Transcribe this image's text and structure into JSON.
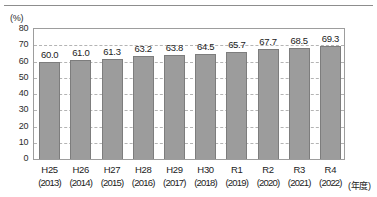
{
  "chart_data": {
    "type": "bar",
    "title": "",
    "xlabel": "(年度)",
    "ylabel": "(%)",
    "ylim": [
      0,
      80
    ],
    "ytick_step": 10,
    "yticks": [
      "80",
      "70",
      "60",
      "50",
      "40",
      "30",
      "20",
      "10",
      "0"
    ],
    "grid": true,
    "legend": "none",
    "categories": [
      "H25",
      "H26",
      "H27",
      "H28",
      "H29",
      "H30",
      "R1",
      "R2",
      "R3",
      "R4"
    ],
    "category_years": [
      "(2013)",
      "(2014)",
      "(2015)",
      "(2016)",
      "(2017)",
      "(2018)",
      "(2019)",
      "(2020)",
      "(2021)",
      "(2022)"
    ],
    "values": [
      60.0,
      61.0,
      61.3,
      63.2,
      63.8,
      64.5,
      65.7,
      67.7,
      68.5,
      69.3
    ],
    "value_labels": [
      "60.0",
      "61.0",
      "61.3",
      "63.2",
      "63.8",
      "64.5",
      "65.7",
      "67.7",
      "68.5",
      "69.3"
    ],
    "bar_color": "#9c9c9c",
    "bar_edge_color": "#7d7d7d",
    "grid_color": "#b4b4b4",
    "frame_color": "#9d9d9d"
  }
}
